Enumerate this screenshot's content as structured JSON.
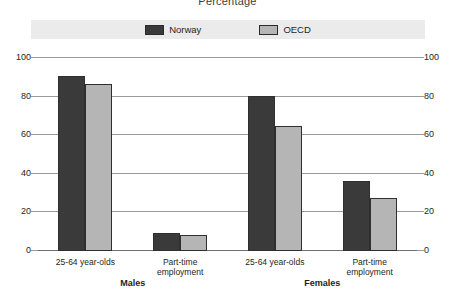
{
  "chart_data": {
    "type": "bar",
    "title": "Percentage",
    "xlabel": "",
    "ylabel": "",
    "ylim": [
      0,
      100
    ],
    "yticks": [
      0,
      20,
      40,
      60,
      80,
      100
    ],
    "grid": true,
    "legend_position": "top-center",
    "categories": [
      "25-64 year-olds",
      "Part-time\nemployment",
      "25-64 year-olds",
      "Part-time\nemployment"
    ],
    "groups": [
      {
        "label": "Males",
        "categories": [
          "25-64 year-olds",
          "Part-time\nemployment"
        ]
      },
      {
        "label": "Females",
        "categories": [
          "25-64 year-olds",
          "Part-time\nemployment"
        ]
      }
    ],
    "series": [
      {
        "name": "Norway",
        "color": "#3a3a3a",
        "values": [
          90,
          9,
          80,
          36
        ]
      },
      {
        "name": "OECD",
        "color": "#b5b5b5",
        "values": [
          86,
          8,
          64,
          27
        ]
      }
    ]
  },
  "axis": {
    "left_ticks": [
      "100",
      "80",
      "60",
      "40",
      "20",
      "0"
    ],
    "right_ticks": [
      "100",
      "80",
      "60",
      "40",
      "20",
      "0"
    ]
  },
  "legend": {
    "items": [
      {
        "label": "Norway",
        "color": "#3a3a3a"
      },
      {
        "label": "OECD",
        "color": "#b5b5b5"
      }
    ]
  }
}
